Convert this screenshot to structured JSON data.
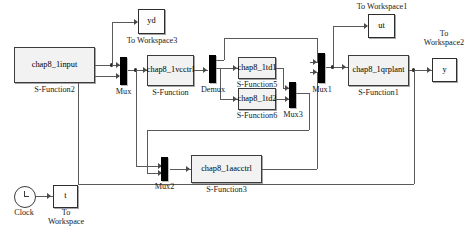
{
  "diagram": {
    "blocks": {
      "input": {
        "label": "chap8_1input",
        "caption": "S-Function2"
      },
      "vcctrl": {
        "label": "chap8_1vcctrl",
        "caption": "S-Function"
      },
      "td1": {
        "label": "chap8_1td1",
        "caption": "S-Function5"
      },
      "td2": {
        "label": "chap8_1td2",
        "caption": "S-Function6"
      },
      "aacctrl": {
        "label": "chap8_1aacctrl",
        "caption": "S-Function3"
      },
      "qrplant": {
        "label": "chap8_1qrplant",
        "caption": "S-Function1"
      },
      "yd": {
        "label": "yd",
        "caption": "To Workspace3"
      },
      "ut": {
        "label": "ut",
        "caption": "To Workspace1"
      },
      "y": {
        "label": "y",
        "caption": "To\nWorkspace2"
      },
      "t": {
        "label": "t",
        "caption": "To\nWorkspace"
      },
      "clock": {
        "label": "",
        "caption": "Clock"
      }
    },
    "mux": {
      "mux": "Mux",
      "demux": "Demux",
      "mux1": "Mux1",
      "mux2": "Mux2",
      "mux3": "Mux3"
    },
    "captions": {
      "to_workspace3": "To Workspace3",
      "to_workspace1": "To Workspace1",
      "to_workspace2_l1": "To",
      "to_workspace2_l2": "Workspace2",
      "to_workspace_l1": "To",
      "to_workspace_l2": "Workspace",
      "clock": "Clock",
      "s_function": "S-Function",
      "s_function1": "S-Function1",
      "s_function2": "S-Function2",
      "s_function3": "S-Function3",
      "s_function5": "S-Function5",
      "s_function6": "S-Function6"
    },
    "colors": {
      "block_fill": "#f2f2f2",
      "block_border": "#3b3b3b",
      "wire": "#5a5a5a",
      "mux_fill": "#000000",
      "background": "#ffffff"
    }
  }
}
